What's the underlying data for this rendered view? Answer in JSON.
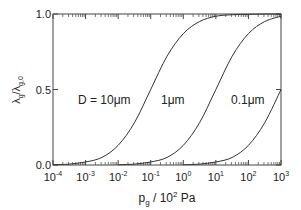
{
  "chart_data": {
    "type": "line",
    "title": "",
    "xlabel": {
      "base": "p",
      "sub": "g",
      "rest": " / 10",
      "sup": "2",
      "unit": " Pa"
    },
    "ylabel": {
      "l1": "λ",
      "s1": "g",
      "slash": "/λ",
      "s2": "g,0"
    },
    "xscale": "log",
    "xlim": [
      0.0001,
      1000
    ],
    "ylim": [
      0,
      1
    ],
    "grid": false,
    "xticks": [
      {
        "base": "10",
        "exp": "-4",
        "value": -4
      },
      {
        "base": "10",
        "exp": "-3",
        "value": -3
      },
      {
        "base": "10",
        "exp": "-2",
        "value": -2
      },
      {
        "base": "10",
        "exp": "-1",
        "value": -1
      },
      {
        "base": "10",
        "exp": "0",
        "value": 0
      },
      {
        "base": "10",
        "exp": "1",
        "value": 1
      },
      {
        "base": "10",
        "exp": "2",
        "value": 2
      },
      {
        "base": "10",
        "exp": "3",
        "value": 3
      }
    ],
    "yticks": [
      {
        "label": "0.0",
        "value": 0
      },
      {
        "label": "0.5",
        "value": 0.5
      },
      {
        "label": "1.0",
        "value": 1
      }
    ],
    "series": [
      {
        "name": "D = 10μm",
        "label": "D = 10μm",
        "log10_x": [
          -4,
          -3.5,
          -3,
          -2.5,
          -2,
          -1.5,
          -1,
          -0.5,
          0,
          0.5,
          1,
          1.5,
          2,
          2.5,
          3
        ],
        "y": [
          0.002,
          0.006,
          0.02,
          0.05,
          0.13,
          0.28,
          0.5,
          0.72,
          0.87,
          0.95,
          0.985,
          0.995,
          0.998,
          1.0,
          1.0
        ]
      },
      {
        "name": "1μm",
        "label": "1μm",
        "log10_x": [
          -2,
          -1.5,
          -1,
          -0.5,
          0,
          0.5,
          1,
          1.5,
          2,
          2.5,
          3
        ],
        "y": [
          0.002,
          0.006,
          0.02,
          0.05,
          0.13,
          0.28,
          0.5,
          0.72,
          0.87,
          0.95,
          0.985
        ]
      },
      {
        "name": "0.1μm",
        "label": "0.1μm",
        "log10_x": [
          0,
          0.5,
          1,
          1.5,
          2,
          2.5,
          3
        ],
        "y": [
          0.002,
          0.006,
          0.02,
          0.05,
          0.13,
          0.28,
          0.5
        ]
      }
    ]
  }
}
